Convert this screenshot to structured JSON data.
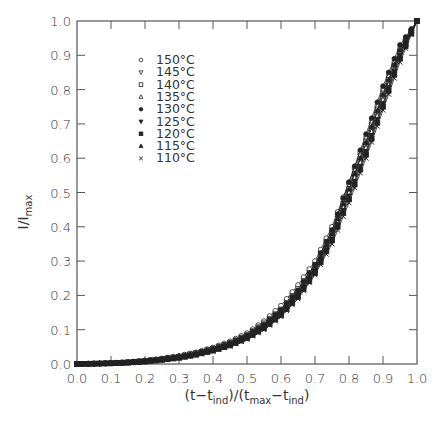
{
  "chart_data": {
    "type": "line",
    "title": "",
    "xlabel": "(t-t_ind)/(t_max-t_ind)",
    "ylabel": "I/I_max",
    "xlim": [
      0.0,
      1.0
    ],
    "ylim": [
      0.0,
      1.0
    ],
    "grid": false,
    "legend_position": "upper-left-inside",
    "x_ticks": [
      "0.0",
      "0.1",
      "0.2",
      "0.3",
      "0.4",
      "0.5",
      "0.6",
      "0.7",
      "0.8",
      "0.9",
      "1.0"
    ],
    "y_ticks": [
      "0.0",
      "0.1",
      "0.2",
      "0.3",
      "0.4",
      "0.5",
      "0.6",
      "0.7",
      "0.8",
      "0.9",
      "1.0"
    ],
    "x": [
      0.0,
      0.05,
      0.1,
      0.15,
      0.2,
      0.25,
      0.3,
      0.35,
      0.4,
      0.45,
      0.5,
      0.55,
      0.6,
      0.65,
      0.7,
      0.75,
      0.8,
      0.85,
      0.9,
      0.95,
      1.0
    ],
    "series": [
      {
        "name": "150°C",
        "marker": "circle-open",
        "values": [
          0,
          0.001,
          0.003,
          0.006,
          0.01,
          0.016,
          0.024,
          0.034,
          0.048,
          0.066,
          0.09,
          0.125,
          0.17,
          0.23,
          0.3,
          0.4,
          0.53,
          0.66,
          0.8,
          0.92,
          1.0
        ]
      },
      {
        "name": "145°C",
        "marker": "triangle-down-open",
        "values": [
          0,
          0.001,
          0.003,
          0.005,
          0.009,
          0.015,
          0.022,
          0.032,
          0.046,
          0.063,
          0.086,
          0.12,
          0.16,
          0.22,
          0.29,
          0.39,
          0.52,
          0.65,
          0.79,
          0.91,
          1.0
        ]
      },
      {
        "name": "140°C",
        "marker": "square-open",
        "values": [
          0,
          0.001,
          0.002,
          0.005,
          0.009,
          0.014,
          0.021,
          0.031,
          0.044,
          0.06,
          0.082,
          0.115,
          0.155,
          0.21,
          0.28,
          0.38,
          0.51,
          0.64,
          0.78,
          0.91,
          1.0
        ]
      },
      {
        "name": "135°C",
        "marker": "triangle-up-open",
        "values": [
          0,
          0.001,
          0.002,
          0.004,
          0.008,
          0.013,
          0.02,
          0.029,
          0.042,
          0.058,
          0.08,
          0.11,
          0.15,
          0.205,
          0.275,
          0.37,
          0.5,
          0.63,
          0.77,
          0.9,
          1.0
        ]
      },
      {
        "name": "130°C",
        "marker": "circle-filled",
        "values": [
          0,
          0.001,
          0.002,
          0.004,
          0.008,
          0.013,
          0.02,
          0.03,
          0.043,
          0.06,
          0.083,
          0.115,
          0.158,
          0.215,
          0.29,
          0.39,
          0.53,
          0.67,
          0.81,
          0.93,
          1.0
        ]
      },
      {
        "name": "125°C",
        "marker": "triangle-down-filled",
        "values": [
          0,
          0.001,
          0.002,
          0.004,
          0.007,
          0.012,
          0.019,
          0.028,
          0.04,
          0.056,
          0.077,
          0.107,
          0.146,
          0.2,
          0.27,
          0.365,
          0.49,
          0.62,
          0.76,
          0.9,
          1.0
        ]
      },
      {
        "name": "120°C",
        "marker": "square-filled",
        "values": [
          0,
          0.001,
          0.002,
          0.004,
          0.007,
          0.012,
          0.018,
          0.027,
          0.039,
          0.054,
          0.075,
          0.104,
          0.142,
          0.195,
          0.265,
          0.36,
          0.48,
          0.61,
          0.75,
          0.89,
          1.0
        ]
      },
      {
        "name": "115°C",
        "marker": "triangle-up-filled",
        "values": [
          0,
          0.001,
          0.002,
          0.004,
          0.008,
          0.013,
          0.02,
          0.029,
          0.041,
          0.057,
          0.079,
          0.11,
          0.15,
          0.205,
          0.28,
          0.38,
          0.51,
          0.645,
          0.785,
          0.915,
          1.0
        ]
      },
      {
        "name": "110°C",
        "marker": "cross",
        "values": [
          0,
          0.001,
          0.002,
          0.003,
          0.006,
          0.011,
          0.017,
          0.026,
          0.037,
          0.052,
          0.072,
          0.1,
          0.138,
          0.19,
          0.26,
          0.35,
          0.47,
          0.6,
          0.74,
          0.88,
          1.0
        ]
      }
    ]
  },
  "legend": {
    "items": [
      "150°C",
      "145°C",
      "140°C",
      "135°C",
      "130°C",
      "125°C",
      "120°C",
      "115°C",
      "110°C"
    ]
  },
  "axes": {
    "xlabel_parts": {
      "a": "(t",
      "b": "−t",
      "c": "ind",
      "d": ")/(t",
      "e": "max",
      "f": "−t",
      "g": "ind",
      "h": ")"
    },
    "ylabel_parts": {
      "a": "I/I",
      "b": "max"
    }
  }
}
